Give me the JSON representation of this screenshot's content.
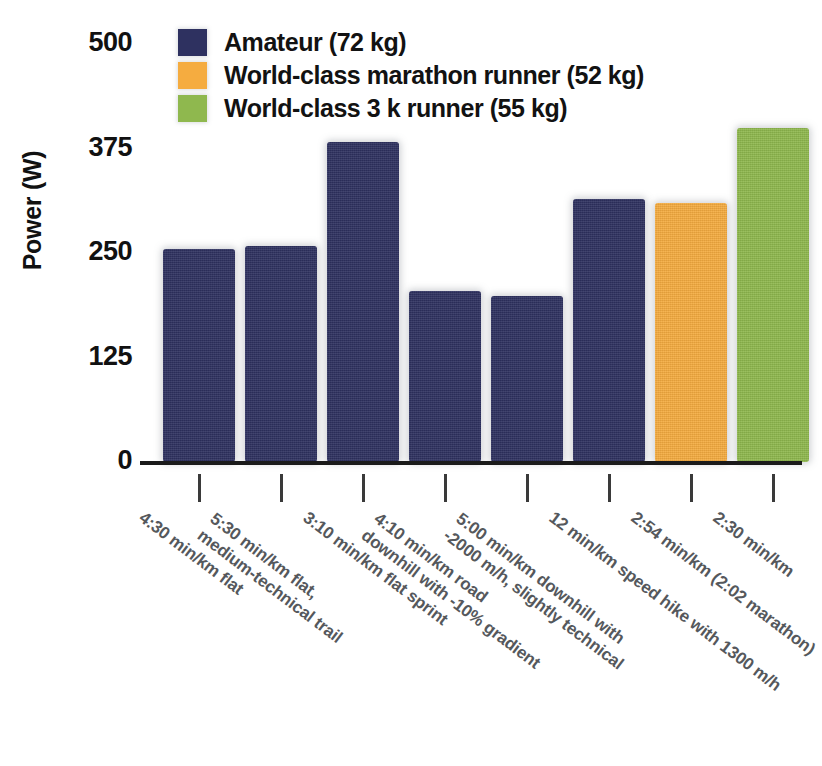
{
  "chart_data": {
    "type": "bar",
    "title": "",
    "xlabel": "",
    "ylabel": "Power (W)",
    "ylim": [
      0,
      500
    ],
    "yticks": [
      0,
      125,
      250,
      375,
      500
    ],
    "grid": false,
    "legend_position": "top-left",
    "categories": [
      "4:30 min/km flat",
      "5:30 min/km flat, medium-technical trail",
      "3:10 min/km flat sprint",
      "4:10 min/km road downhill with -10% gradient",
      "5:00 min/km downhill with -2000 m/h, slightly technical",
      "12 min/km speed hike with 1300 m/h",
      "2:54 min/km (2:02 marathon)",
      "2:30 min/km"
    ],
    "category_lines": [
      [
        "4:30 min/km flat"
      ],
      [
        "5:30 min/km flat,",
        "medium-technical trail"
      ],
      [
        "3:10 min/km flat sprint"
      ],
      [
        "4:10 min/km road",
        "downhill with -10% gradient"
      ],
      [
        "5:00 min/km downhill with",
        "-2000 m/h, slightly technical"
      ],
      [
        "12 min/km speed hike with 1300 m/h"
      ],
      [
        "2:54 min/km (2:02 marathon)"
      ],
      [
        "2:30 min/km"
      ]
    ],
    "values": [
      255,
      258,
      383,
      205,
      198,
      315,
      310,
      400
    ],
    "bar_groups": [
      0,
      0,
      0,
      0,
      0,
      0,
      1,
      2
    ],
    "series": [
      {
        "name": "Amateur (72 kg)",
        "color": "#2e3160"
      },
      {
        "name": "World-class marathon runner (52 kg)",
        "color": "#f5ac40"
      },
      {
        "name": "World-class 3 k runner (55 kg)",
        "color": "#8fb84e"
      }
    ]
  },
  "legend": {
    "items": [
      {
        "label": "Amateur (72 kg)",
        "color": "#2e3160",
        "swatch_name": "legend-swatch-amateur"
      },
      {
        "label": "World-class marathon runner (52 kg)",
        "color": "#f5ac40",
        "swatch_name": "legend-swatch-marathon"
      },
      {
        "label": "World-class 3 k runner (55 kg)",
        "color": "#8fb84e",
        "swatch_name": "legend-swatch-3k"
      }
    ]
  },
  "axes": {
    "y_title": "Power (W)",
    "y_tick_labels": [
      "500",
      "375",
      "250",
      "125",
      "0"
    ]
  }
}
